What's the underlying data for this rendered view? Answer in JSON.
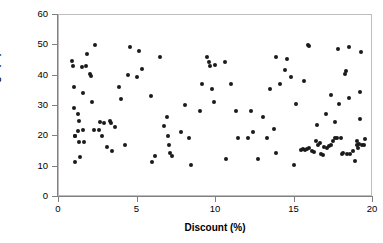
{
  "chart_data": {
    "type": "scatter",
    "title": "",
    "xlabel": "Discount (%)",
    "ylabel": "Net Sales Above Average (%)",
    "xlim": [
      0,
      20
    ],
    "ylim": [
      0,
      60
    ],
    "xticks": [
      0,
      5,
      10,
      15,
      20
    ],
    "yticks": [
      0,
      10,
      20,
      30,
      40,
      50,
      60
    ],
    "grid": false,
    "legend": false,
    "marker": "filled-circle",
    "marker_color": "#1a1a1a",
    "marker_size_px": 4,
    "series": [
      {
        "name": "Stores",
        "points": [
          [
            0.85,
            45.0
          ],
          [
            0.88,
            43.2
          ],
          [
            0.95,
            36.3
          ],
          [
            0.95,
            29.3
          ],
          [
            1.0,
            20.2
          ],
          [
            1.02,
            20.0
          ],
          [
            1.05,
            11.4
          ],
          [
            1.18,
            27.2
          ],
          [
            1.22,
            21.8
          ],
          [
            1.25,
            18.2
          ],
          [
            1.3,
            25.2
          ],
          [
            1.35,
            13.1
          ],
          [
            1.45,
            42.8
          ],
          [
            1.52,
            34.2
          ],
          [
            1.6,
            18.0
          ],
          [
            1.72,
            43.2
          ],
          [
            1.8,
            47.3
          ],
          [
            1.95,
            40.5
          ],
          [
            2.05,
            40.0
          ],
          [
            2.1,
            31.3
          ],
          [
            2.2,
            22.1
          ],
          [
            2.3,
            50.2
          ],
          [
            2.55,
            22.0
          ],
          [
            2.6,
            24.6
          ],
          [
            2.75,
            20.0
          ],
          [
            3.05,
            16.4
          ],
          [
            3.25,
            25.0
          ],
          [
            3.3,
            24.3
          ],
          [
            3.4,
            15.3
          ],
          [
            3.55,
            23.2
          ],
          [
            3.85,
            36.3
          ],
          [
            3.95,
            32.3
          ],
          [
            4.2,
            17.1
          ],
          [
            4.4,
            40.3
          ],
          [
            4.5,
            49.3
          ],
          [
            4.95,
            39.4
          ],
          [
            5.1,
            48.2
          ],
          [
            5.3,
            42.2
          ],
          [
            5.85,
            33.4
          ],
          [
            5.95,
            11.4
          ],
          [
            6.45,
            46.2
          ],
          [
            6.7,
            23.3
          ],
          [
            6.85,
            26.3
          ],
          [
            6.95,
            20.2
          ],
          [
            7.0,
            17.3
          ],
          [
            7.05,
            14.6
          ],
          [
            7.2,
            13.4
          ],
          [
            7.75,
            21.3
          ],
          [
            8.0,
            30.3
          ],
          [
            8.25,
            19.4
          ],
          [
            8.4,
            10.4
          ],
          [
            8.95,
            28.5
          ],
          [
            9.1,
            37.3
          ],
          [
            9.4,
            46.3
          ],
          [
            9.55,
            44.4
          ],
          [
            9.6,
            43.3
          ],
          [
            9.75,
            35.5
          ],
          [
            9.85,
            31.4
          ],
          [
            10.6,
            44.4
          ],
          [
            10.65,
            12.6
          ],
          [
            10.95,
            37.3
          ],
          [
            11.3,
            28.5
          ],
          [
            11.4,
            19.5
          ],
          [
            12.05,
            19.5
          ],
          [
            12.2,
            28.5
          ],
          [
            12.35,
            21.4
          ],
          [
            12.65,
            12.6
          ],
          [
            13.0,
            26.4
          ],
          [
            13.45,
            35.5
          ],
          [
            13.7,
            22.3
          ],
          [
            13.8,
            14.4
          ],
          [
            13.85,
            46.3
          ],
          [
            14.05,
            37.4
          ],
          [
            14.4,
            42.0
          ],
          [
            14.55,
            45.5
          ],
          [
            14.8,
            39.5
          ],
          [
            14.95,
            10.5
          ],
          [
            15.1,
            30.5
          ],
          [
            15.4,
            15.6
          ],
          [
            15.55,
            15.8
          ],
          [
            15.6,
            38.3
          ],
          [
            15.7,
            15.5
          ],
          [
            15.8,
            15.9
          ],
          [
            15.85,
            50.0
          ],
          [
            15.9,
            49.8
          ],
          [
            15.95,
            16.0
          ],
          [
            16.1,
            15.2
          ],
          [
            16.25,
            15.0
          ],
          [
            16.35,
            18.3
          ],
          [
            16.45,
            23.7
          ],
          [
            16.5,
            17.0
          ],
          [
            16.6,
            17.7
          ],
          [
            16.7,
            14.2
          ],
          [
            16.8,
            14.0
          ],
          [
            16.9,
            16.5
          ],
          [
            17.0,
            27.5
          ],
          [
            17.1,
            16.3
          ],
          [
            17.2,
            16.8
          ],
          [
            17.3,
            33.5
          ],
          [
            17.35,
            17.2
          ],
          [
            17.45,
            18.3
          ],
          [
            17.55,
            24.6
          ],
          [
            17.6,
            19.3
          ],
          [
            17.7,
            19.6
          ],
          [
            17.8,
            48.7
          ],
          [
            17.85,
            30.8
          ],
          [
            17.95,
            19.5
          ],
          [
            18.0,
            14.3
          ],
          [
            18.1,
            14.4
          ],
          [
            18.2,
            40.6
          ],
          [
            18.3,
            41.4
          ],
          [
            18.35,
            14.2
          ],
          [
            18.45,
            49.5
          ],
          [
            18.5,
            32.6
          ],
          [
            18.55,
            14.3
          ],
          [
            18.7,
            15.3
          ],
          [
            18.85,
            12.0
          ],
          [
            18.95,
            17.2
          ],
          [
            19.0,
            18.3
          ],
          [
            19.05,
            16.2
          ],
          [
            19.1,
            17.5
          ],
          [
            19.15,
            25.7
          ],
          [
            19.2,
            34.6
          ],
          [
            19.25,
            47.7
          ],
          [
            19.3,
            17.3
          ],
          [
            19.4,
            17.0
          ],
          [
            19.5,
            19.2
          ],
          [
            1.55,
            22.0
          ],
          [
            2.85,
            24.3
          ],
          [
            6.1,
            13.5
          ],
          [
            9.95,
            43.5
          ],
          [
            13.25,
            19.6
          ]
        ]
      }
    ]
  },
  "axes": {
    "x_tick_labels": [
      "0",
      "5",
      "10",
      "15",
      "20"
    ],
    "y_tick_labels": [
      "0",
      "10",
      "20",
      "30",
      "40",
      "50",
      "60"
    ]
  }
}
